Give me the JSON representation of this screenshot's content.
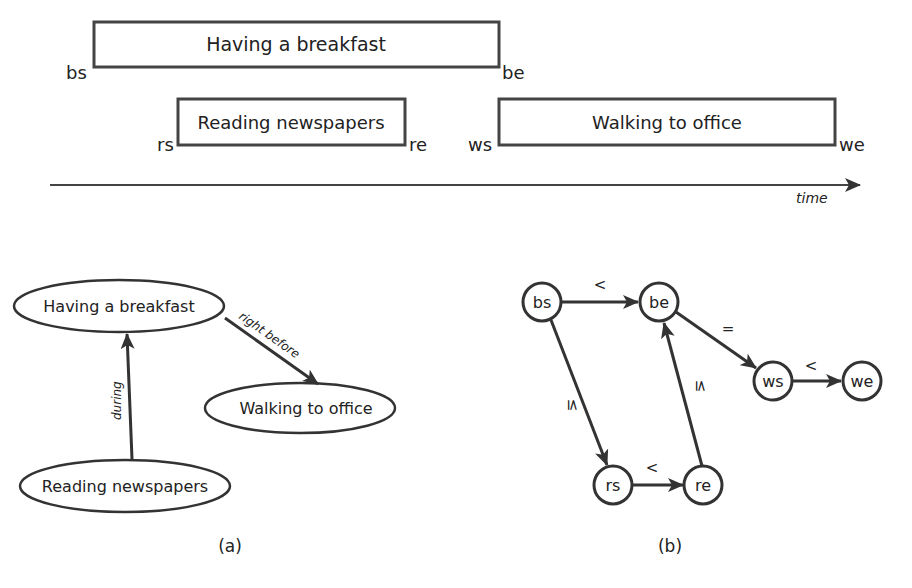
{
  "timeline": {
    "events": [
      {
        "label": "Having a breakfast",
        "start": "bs",
        "end": "be"
      },
      {
        "label": "Reading newspapers",
        "start": "rs",
        "end": "re"
      },
      {
        "label": "Walking to office",
        "start": "ws",
        "end": "we"
      }
    ],
    "axis_label": "time"
  },
  "panel_a": {
    "nodes": [
      "Having a breakfast",
      "Walking to office",
      "Reading newspapers"
    ],
    "edges": [
      {
        "from": "Having a breakfast",
        "to": "Walking to office",
        "label": "right before"
      },
      {
        "from": "Reading newspapers",
        "to": "Having a breakfast",
        "label": "during"
      }
    ],
    "caption": "(a)"
  },
  "panel_b": {
    "nodes": [
      "bs",
      "be",
      "ws",
      "we",
      "rs",
      "re"
    ],
    "edges": [
      {
        "from": "bs",
        "to": "be",
        "label": "<"
      },
      {
        "from": "be",
        "to": "ws",
        "label": "="
      },
      {
        "from": "ws",
        "to": "we",
        "label": "<"
      },
      {
        "from": "bs",
        "to": "rs",
        "label": "≤"
      },
      {
        "from": "rs",
        "to": "re",
        "label": "<"
      },
      {
        "from": "re",
        "to": "be",
        "label": "≤"
      }
    ],
    "caption": "(b)"
  }
}
